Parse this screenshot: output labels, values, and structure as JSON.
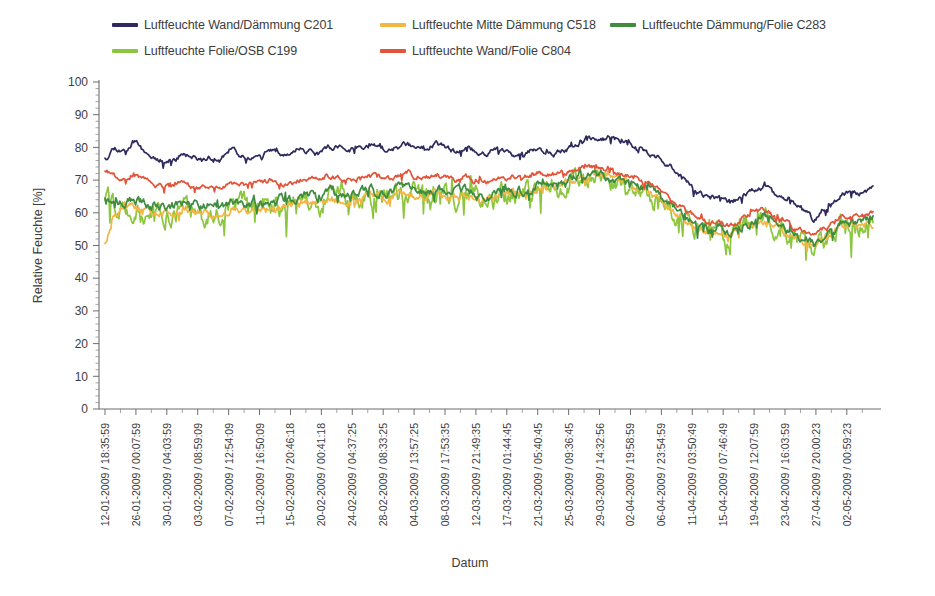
{
  "chart_data": {
    "type": "line",
    "title": "",
    "xlabel": "Datum",
    "ylabel": "Relative Feuchte [%]",
    "ylim": [
      0,
      100
    ],
    "ytick_step": 10,
    "yticks": [
      0,
      10,
      20,
      30,
      40,
      50,
      60,
      70,
      80,
      90,
      100
    ],
    "grid": false,
    "legend_position": "top",
    "minor_ticks_per_major_y": 5,
    "x_tick_count": 50,
    "categories": [
      "12-01-2009 / 18:35:59",
      "26-01-2009 / 00:07:59",
      "30-01-2009 / 04:03:59",
      "03-02-2009 / 08:59:09",
      "07-02-2009 / 12:54:09",
      "11-02-2009 / 16:50:09",
      "15-02-2009 / 20:46:18",
      "20-02-2009 / 00:41:18",
      "24-02-2009 / 04:37:25",
      "28-02-2009 / 08:33:25",
      "04-03-2009 / 13:57:25",
      "08-03-2009 / 17:53:35",
      "12-03-2009 / 21:49:35",
      "17-03-2009 / 01:44:45",
      "21-03-2009 / 05:40:45",
      "25-03-2009 / 09:36:45",
      "29-03-2009 / 14:32:56",
      "02-04-2009 / 19:58:59",
      "06-04-2009 / 23:54:59",
      "11-04-2009 / 03:50:49",
      "15-04-2009 / 07:46:49",
      "19-04-2009 / 12:07:59",
      "23-04-2009 / 16:03:59",
      "27-04-2009 / 20:00:23",
      "02-05-2009 / 00:59:23"
    ],
    "series": [
      {
        "name": "Luftfeuchte Wand/Dämmung C201",
        "color": "#2e2a5e",
        "noise": 0.9,
        "seed": 11,
        "control_values": [
          77,
          80,
          79,
          82,
          79,
          77,
          76,
          76,
          78,
          77,
          76,
          77,
          76,
          79,
          78,
          77,
          77,
          79,
          78,
          77,
          80,
          79,
          78,
          80,
          80,
          79,
          80,
          81,
          80,
          79,
          80,
          81,
          80,
          80,
          81,
          80,
          79,
          80,
          79,
          78,
          79,
          79,
          78,
          78,
          79,
          79,
          78,
          79,
          80,
          81,
          83,
          82,
          83,
          82,
          81,
          79,
          78,
          77,
          75,
          72,
          69,
          66,
          65,
          64,
          63,
          64,
          66,
          67,
          68,
          66,
          64,
          62,
          60,
          58,
          61,
          64,
          66,
          66,
          66,
          67
        ]
      },
      {
        "name": "Luftfeuchte Mitte Dämmung C518",
        "color": "#f4b643",
        "noise": 1.2,
        "seed": 23,
        "control_values": [
          51,
          60,
          63,
          62,
          61,
          60,
          60,
          60,
          61,
          60,
          60,
          60,
          59,
          61,
          61,
          61,
          61,
          62,
          62,
          62,
          63,
          63,
          63,
          64,
          64,
          64,
          64,
          65,
          65,
          64,
          65,
          66,
          65,
          65,
          66,
          65,
          65,
          65,
          65,
          64,
          65,
          66,
          66,
          66,
          67,
          68,
          68,
          69,
          70,
          71,
          72,
          71,
          71,
          70,
          69,
          67,
          66,
          64,
          62,
          59,
          57,
          55,
          54,
          54,
          53,
          54,
          56,
          57,
          58,
          56,
          54,
          52,
          51,
          50,
          52,
          54,
          56,
          56,
          56,
          57
        ]
      },
      {
        "name": "Luftfeuchte Dämmung/Folie C283",
        "color": "#3f8c3f",
        "noise": 1.6,
        "seed": 37,
        "control_values": [
          65,
          64,
          63,
          64,
          63,
          62,
          62,
          62,
          63,
          62,
          62,
          62,
          61,
          63,
          63,
          63,
          63,
          64,
          64,
          64,
          65,
          65,
          64,
          66,
          66,
          65,
          66,
          67,
          66,
          66,
          67,
          67,
          66,
          66,
          67,
          67,
          66,
          67,
          66,
          65,
          66,
          67,
          67,
          67,
          68,
          69,
          69,
          70,
          71,
          72,
          72,
          72,
          71,
          70,
          69,
          68,
          67,
          65,
          63,
          60,
          58,
          56,
          55,
          55,
          54,
          55,
          57,
          58,
          59,
          57,
          55,
          53,
          52,
          51,
          53,
          55,
          57,
          57,
          57,
          58
        ]
      },
      {
        "name": "Luftfeuchte Folie/OSB C199",
        "color": "#8cc63e",
        "noise": 3.4,
        "seed": 59,
        "control_values": [
          65,
          62,
          60,
          62,
          60,
          59,
          59,
          60,
          61,
          60,
          59,
          60,
          59,
          62,
          62,
          62,
          62,
          63,
          63,
          63,
          64,
          64,
          63,
          65,
          65,
          64,
          65,
          66,
          65,
          65,
          66,
          66,
          65,
          65,
          66,
          66,
          65,
          66,
          65,
          64,
          65,
          66,
          66,
          66,
          67,
          68,
          68,
          69,
          70,
          71,
          71,
          71,
          70,
          69,
          68,
          67,
          66,
          64,
          62,
          59,
          57,
          55,
          54,
          54,
          53,
          54,
          56,
          57,
          58,
          56,
          54,
          52,
          50,
          49,
          51,
          54,
          56,
          56,
          56,
          57
        ]
      },
      {
        "name": "Luftfeuchte Wand/Folie C804",
        "color": "#e2553a",
        "noise": 0.9,
        "seed": 71,
        "control_values": [
          73,
          71,
          70,
          72,
          70,
          68,
          68,
          68,
          69,
          68,
          68,
          68,
          67,
          69,
          69,
          69,
          69,
          70,
          69,
          69,
          70,
          70,
          70,
          71,
          71,
          70,
          71,
          71,
          71,
          70,
          71,
          72,
          71,
          71,
          71,
          71,
          70,
          71,
          70,
          70,
          70,
          71,
          71,
          71,
          72,
          72,
          72,
          73,
          73,
          74,
          74,
          73,
          73,
          72,
          71,
          70,
          69,
          67,
          65,
          62,
          60,
          58,
          57,
          57,
          56,
          57,
          59,
          60,
          61,
          59,
          57,
          55,
          54,
          53,
          55,
          57,
          59,
          59,
          59,
          60
        ]
      }
    ]
  },
  "legend": {
    "rows": [
      [
        {
          "label": "Luftfeuchte Wand/Dämmung C201",
          "color": "#2e2a5e"
        },
        {
          "label": "Luftfeuchte Mitte Dämmung C518",
          "color": "#f4b643"
        },
        {
          "label": "Luftfeuchte Dämmung/Folie C283",
          "color": "#3f8c3f"
        }
      ],
      [
        {
          "label": "Luftfeuchte Folie/OSB C199",
          "color": "#8cc63e"
        },
        {
          "label": "Luftfeuchte Wand/Folie C804",
          "color": "#e2553a"
        }
      ]
    ]
  }
}
